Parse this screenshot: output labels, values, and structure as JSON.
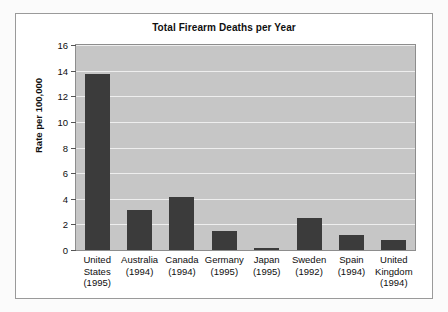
{
  "card": {
    "background_color": "#ffffff",
    "border_color": "#9a9a9a",
    "page_background_color": "#fbfbfb"
  },
  "chart_data": {
    "type": "bar",
    "title": "Total Firearm Deaths per Year",
    "xlabel": "",
    "ylabel": "Rate per 100,000",
    "ylim": [
      0,
      16
    ],
    "ytick_step": 2,
    "ytick_labels": [
      "0",
      "2",
      "4",
      "6",
      "8",
      "10",
      "12",
      "14",
      "16"
    ],
    "grid": true,
    "grid_axis": "y",
    "legend": false,
    "legend_position": "none",
    "orientation": "vertical",
    "categories": [
      "United States (1995)",
      "Australia (1994)",
      "Canada (1994)",
      "Germany (1995)",
      "Japan (1995)",
      "Sweden (1992)",
      "Spain (1994)",
      "United Kingdom (1994)"
    ],
    "category_lines": [
      [
        "United",
        "States",
        "(1995)"
      ],
      [
        "Australia",
        "(1994)"
      ],
      [
        "Canada",
        "(1994)"
      ],
      [
        "Germany",
        "(1995)"
      ],
      [
        "Japan",
        "(1995)"
      ],
      [
        "Sweden",
        "(1992)"
      ],
      [
        "Spain",
        "(1994)"
      ],
      [
        "United",
        "Kingdom",
        "(1994)"
      ]
    ],
    "values": [
      13.7,
      3.1,
      4.1,
      1.5,
      0.15,
      2.5,
      1.2,
      0.8
    ],
    "bar_color": "#3b3b3b",
    "plot_background_color": "#c6c6c6",
    "gridline_color": "#eeeeee",
    "axis_color": "#8d8d8d"
  }
}
